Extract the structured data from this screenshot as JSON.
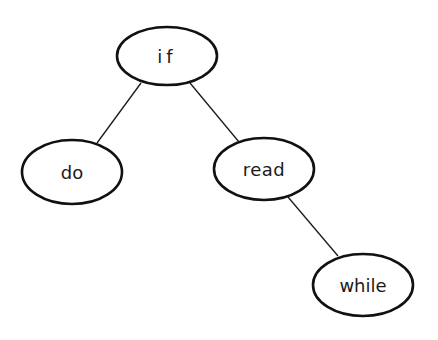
{
  "diagram": {
    "type": "tree",
    "nodes": [
      {
        "id": "if",
        "label": "if",
        "cx": 167,
        "cy": 56,
        "rx": 50,
        "ry": 29,
        "letter_spacing": 4
      },
      {
        "id": "do",
        "label": "do",
        "cx": 72,
        "cy": 172,
        "rx": 50,
        "ry": 32,
        "letter_spacing": 0
      },
      {
        "id": "read",
        "label": "read",
        "cx": 264,
        "cy": 169,
        "rx": 50,
        "ry": 31,
        "letter_spacing": 0.5
      },
      {
        "id": "while",
        "label": "while",
        "cx": 363,
        "cy": 285,
        "rx": 50,
        "ry": 31,
        "letter_spacing": 0
      }
    ],
    "edges": [
      {
        "from": "if",
        "to": "do",
        "x1": 141,
        "y1": 83,
        "x2": 97,
        "y2": 143
      },
      {
        "from": "if",
        "to": "read",
        "x1": 190,
        "y1": 83,
        "x2": 239,
        "y2": 142
      },
      {
        "from": "read",
        "to": "while",
        "x1": 288,
        "y1": 197,
        "x2": 338,
        "y2": 256
      }
    ],
    "colors": {
      "stroke": "#111111",
      "text": "#1a1a1a",
      "background": "#ffffff"
    }
  }
}
